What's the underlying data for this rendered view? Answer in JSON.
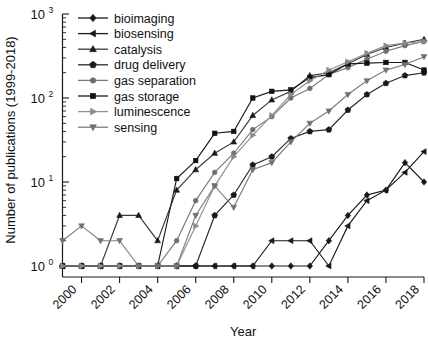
{
  "chart_data": {
    "type": "line",
    "title": "",
    "xlabel": "Year",
    "ylabel": "Number of publications (1999-2018)",
    "yscale": "log",
    "ylim": [
      1,
      1000
    ],
    "xlim": [
      1999,
      2018
    ],
    "grid": false,
    "legend_position": "top-left",
    "ytick_labels": [
      "10^0",
      "10^1",
      "10^2",
      "10^3"
    ],
    "ytick_values": [
      1,
      10,
      100,
      1000
    ],
    "ytick_mantissas": [
      "10",
      "10",
      "10",
      "10"
    ],
    "ytick_exponents": [
      "0",
      "1",
      "2",
      "3"
    ],
    "xtick_labels": [
      "2000",
      "2002",
      "2004",
      "2006",
      "2008",
      "2010",
      "2012",
      "2014",
      "2016",
      "2018"
    ],
    "xtick_values": [
      2000,
      2002,
      2004,
      2006,
      2008,
      2010,
      2012,
      2014,
      2016,
      2018
    ],
    "x": [
      1999,
      2000,
      2001,
      2002,
      2003,
      2004,
      2005,
      2006,
      2007,
      2008,
      2009,
      2010,
      2011,
      2012,
      2013,
      2014,
      2015,
      2016,
      2017,
      2018
    ],
    "series": [
      {
        "name": "bioimaging",
        "marker": "diamond",
        "color": "#1a1a1a",
        "line_color": "#1a1a1a",
        "values": [
          1,
          1,
          1,
          1,
          1,
          1,
          1,
          1,
          1,
          1,
          1,
          1,
          1,
          1,
          2,
          4,
          7,
          8,
          17,
          10
        ]
      },
      {
        "name": "biosensing",
        "marker": "triangle-left",
        "color": "#1a1a1a",
        "line_color": "#1a1a1a",
        "values": [
          1,
          1,
          1,
          1,
          1,
          1,
          1,
          1,
          1,
          1,
          1,
          2,
          2,
          2,
          1,
          3,
          6,
          8,
          13,
          23
        ]
      },
      {
        "name": "catalysis",
        "marker": "triangle-up",
        "color": "#1a1a1a",
        "line_color": "#3a3a3a",
        "values": [
          1,
          1,
          1,
          4,
          4,
          2,
          8,
          14,
          22,
          30,
          62,
          95,
          120,
          185,
          200,
          255,
          330,
          400,
          450,
          500
        ]
      },
      {
        "name": "drug delivery",
        "marker": "pentagon",
        "color": "#1a1a1a",
        "line_color": "#2a2a2a",
        "values": [
          1,
          1,
          1,
          1,
          1,
          1,
          1,
          1,
          4,
          7,
          16,
          20,
          33,
          40,
          42,
          72,
          110,
          150,
          185,
          200
        ]
      },
      {
        "name": "gas separation",
        "marker": "circle",
        "color": "#6e6e6e",
        "line_color": "#7a7a7a",
        "values": [
          1,
          1,
          1,
          1,
          1,
          1,
          2,
          6,
          13,
          22,
          42,
          60,
          100,
          130,
          190,
          230,
          290,
          360,
          420,
          470
        ]
      },
      {
        "name": "gas storage",
        "marker": "square",
        "color": "#111111",
        "line_color": "#1a1a1a",
        "values": [
          1,
          1,
          1,
          1,
          1,
          1,
          11,
          18,
          38,
          40,
          100,
          120,
          125,
          175,
          190,
          255,
          260,
          265,
          265,
          215
        ]
      },
      {
        "name": "luminescence",
        "marker": "triangle-right",
        "color": "#8a8a8a",
        "line_color": "#909090",
        "values": [
          1,
          1,
          1,
          1,
          1,
          1,
          1,
          3,
          9,
          20,
          36,
          62,
          110,
          160,
          215,
          270,
          340,
          420,
          450,
          470
        ]
      },
      {
        "name": "sensing",
        "marker": "triangle-down",
        "color": "#707070",
        "line_color": "#7d7d7d",
        "values": [
          2,
          3,
          2,
          2,
          1,
          1,
          1,
          4,
          9,
          5,
          14,
          17,
          30,
          50,
          70,
          110,
          160,
          215,
          250,
          310
        ]
      }
    ]
  },
  "legend": {
    "items": [
      {
        "label": "bioimaging"
      },
      {
        "label": "biosensing"
      },
      {
        "label": "catalysis"
      },
      {
        "label": "drug delivery"
      },
      {
        "label": "gas separation"
      },
      {
        "label": "gas storage"
      },
      {
        "label": "luminescence"
      },
      {
        "label": "sensing"
      }
    ]
  },
  "axes": {
    "x_title": "Year",
    "y_title": "Number of publications (1999-2018)"
  }
}
